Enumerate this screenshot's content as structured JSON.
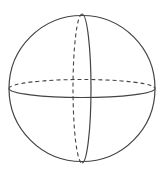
{
  "diagram": {
    "title": "",
    "type": "sphere",
    "stroke_color": "#444444",
    "background": "#ffffff",
    "sphere": {
      "cx": 82,
      "cy": 88.5,
      "r": 73
    },
    "equator": {
      "cx": 82,
      "cy": 88.5,
      "rx": 73,
      "ry": 9
    },
    "meridian": {
      "cx": 82,
      "cy": 88.5,
      "rx": 9,
      "ry": 74.5
    }
  }
}
